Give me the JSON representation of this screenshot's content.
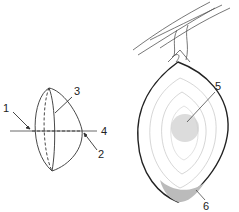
{
  "diagram": {
    "left_figure": {
      "description": "lens-shaped fruit/structure with axis",
      "labels": [
        {
          "id": "1",
          "text": "1"
        },
        {
          "id": "2",
          "text": "2"
        },
        {
          "id": "3",
          "text": "3"
        },
        {
          "id": "4",
          "text": "4"
        }
      ]
    },
    "right_figure": {
      "description": "ovoid body attached to branch with concentric layers",
      "labels": [
        {
          "id": "5",
          "text": "5"
        },
        {
          "id": "6",
          "text": "6"
        }
      ]
    },
    "colors": {
      "line": "#333333",
      "light_line": "#999999",
      "center_fill": "#dcdcdc"
    }
  }
}
